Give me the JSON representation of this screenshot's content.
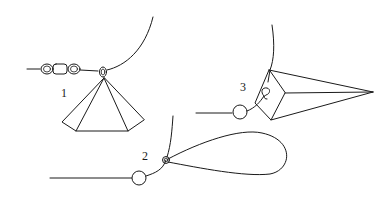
{
  "diagram": {
    "background": "#ffffff",
    "line_color": "#1a1a1a",
    "figures": [
      {
        "id": "fig1",
        "label": "1",
        "description": "Pyramid sinker attached via eye to line with barrel swivel chain"
      },
      {
        "id": "fig2",
        "label": "2",
        "description": "Bead on line with teardrop loop sinker attached at ring"
      },
      {
        "id": "fig3",
        "label": "3",
        "description": "Pointed pyramid/cone sinker with snap, bead on line"
      }
    ]
  }
}
